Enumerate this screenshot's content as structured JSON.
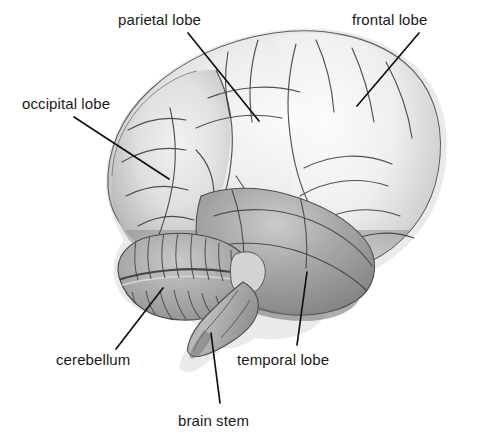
{
  "figure": {
    "background_color": "#ffffff",
    "text_color": "#1a1a1a",
    "leader_line_color": "#111111",
    "width": 492,
    "height": 442
  },
  "labels": [
    {
      "id": "parietal-lobe",
      "text": "parietal lobe",
      "x": 118,
      "y": 12,
      "leader": {
        "x1": 188,
        "y1": 33,
        "x2": 259,
        "y2": 121
      }
    },
    {
      "id": "frontal-lobe",
      "text": "frontal lobe",
      "x": 352,
      "y": 12,
      "leader": {
        "x1": 419,
        "y1": 33,
        "x2": 357,
        "y2": 106
      }
    },
    {
      "id": "occipital-lobe",
      "text": "occipital lobe",
      "x": 22,
      "y": 96,
      "leader": {
        "x1": 74,
        "y1": 117,
        "x2": 169,
        "y2": 179
      }
    },
    {
      "id": "cerebellum",
      "text": "cerebellum",
      "x": 56,
      "y": 352,
      "leader": {
        "x1": 116,
        "y1": 349,
        "x2": 163,
        "y2": 288
      }
    },
    {
      "id": "temporal-lobe",
      "text": "temporal lobe",
      "x": 237,
      "y": 352,
      "leader": {
        "x1": 297,
        "y1": 345,
        "x2": 307,
        "y2": 272
      }
    },
    {
      "id": "brain-stem",
      "text": "brain stem",
      "x": 178,
      "y": 413,
      "leader": {
        "x1": 220,
        "y1": 403,
        "x2": 211,
        "y2": 333
      }
    }
  ],
  "structures": [
    {
      "id": "cerebrum",
      "name": "cerebrum"
    },
    {
      "id": "frontal-lobe-region",
      "name": "frontal lobe"
    },
    {
      "id": "parietal-lobe-region",
      "name": "parietal lobe"
    },
    {
      "id": "occipital-lobe-region",
      "name": "occipital lobe"
    },
    {
      "id": "temporal-lobe-region",
      "name": "temporal lobe"
    },
    {
      "id": "cerebellum-region",
      "name": "cerebellum"
    },
    {
      "id": "brain-stem-region",
      "name": "brain stem"
    }
  ]
}
